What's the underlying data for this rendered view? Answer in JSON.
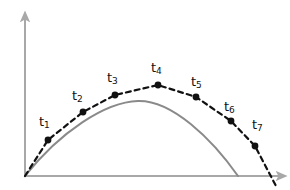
{
  "figure": {
    "background_color": "#ffffff"
  },
  "axes": {
    "color": "#a8a8a8",
    "origin": {
      "x": 25,
      "y": 176
    },
    "y_axis": {
      "name": "y-axis",
      "x": 25,
      "y_top": 13,
      "y_bottom": 176,
      "arrow": "up"
    },
    "x_axis": {
      "name": "x-axis",
      "y": 176,
      "x_left": 25,
      "x_right": 285,
      "arrow": "right"
    }
  },
  "curves": {
    "ideal": {
      "name": "ideal-parabola",
      "style": "solid",
      "color": "#8a8a8a",
      "width": 2,
      "path": "M 25 176 C 60 132, 105 102, 138 101 C 172 100, 212 139, 238 176"
    },
    "sampled": {
      "name": "sampled-trajectory",
      "style": "dashed",
      "color": "#111111",
      "width": 2.2,
      "dash": "5 4",
      "path": "M 25 176 L 48 140 L 83 112 L 115 95 L 158 85 L 196 97 L 231 121 L 255 146 L 276 186"
    }
  },
  "points": [
    {
      "id": "t1",
      "label": "t",
      "sub": "1",
      "cx": 48,
      "cy": 140,
      "r": 3.4,
      "label_x": 39,
      "label_y": 115
    },
    {
      "id": "t2",
      "label": "t",
      "sub": "2",
      "cx": 83,
      "cy": 112,
      "r": 3.4,
      "label_x": 72,
      "label_y": 89
    },
    {
      "id": "t3",
      "label": "t",
      "sub": "3",
      "cx": 115,
      "cy": 95,
      "r": 3.4,
      "label_x": 107,
      "label_y": 71
    },
    {
      "id": "t4",
      "label": "t",
      "sub": "4",
      "cx": 158,
      "cy": 85,
      "r": 3.4,
      "label_x": 151,
      "label_y": 61
    },
    {
      "id": "t5",
      "label": "t",
      "sub": "5",
      "cx": 196,
      "cy": 97,
      "r": 3.4,
      "label_x": 191,
      "label_y": 75
    },
    {
      "id": "t6",
      "label": "t",
      "sub": "6",
      "cx": 231,
      "cy": 121,
      "r": 3.4,
      "label_x": 224,
      "label_y": 100
    },
    {
      "id": "t7",
      "label": "t",
      "sub": "7",
      "cx": 255,
      "cy": 146,
      "r": 3.4,
      "label_x": 252,
      "label_y": 118
    }
  ],
  "chart_data": {
    "type": "line",
    "xlabel": "",
    "ylabel": "",
    "grid": false,
    "legend": "none",
    "xlim": [
      0,
      290
    ],
    "ylim": [
      0,
      190
    ],
    "series": [
      {
        "name": "ideal-parabola",
        "style": "solid",
        "color": "#8a8a8a",
        "x": [
          25,
          60,
          90,
          115,
          138,
          165,
          195,
          220,
          238
        ],
        "y": [
          176,
          134,
          114,
          104,
          101,
          106,
          125,
          152,
          176
        ]
      },
      {
        "name": "sampled-trajectory",
        "style": "dashed",
        "color": "#111111",
        "x": [
          25,
          48,
          83,
          115,
          158,
          196,
          231,
          255,
          276
        ],
        "y": [
          176,
          140,
          112,
          95,
          85,
          97,
          121,
          146,
          186
        ],
        "point_labels": [
          "",
          "t1",
          "t2",
          "t3",
          "t4",
          "t5",
          "t6",
          "t7",
          ""
        ]
      }
    ]
  }
}
